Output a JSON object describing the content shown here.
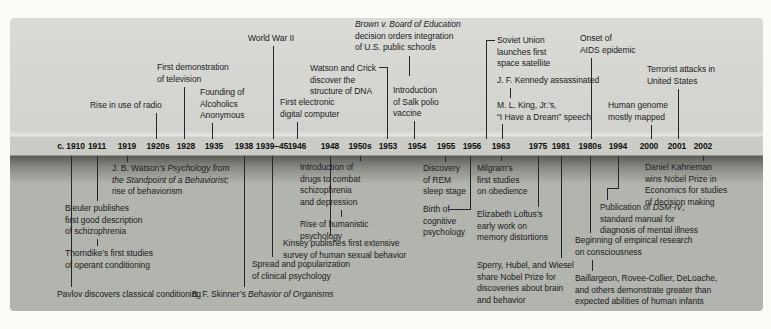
{
  "figure": {
    "type": "timeline",
    "colors": {
      "page_bg": "#fbfbf8",
      "panel_top_bg": "#d5d6d1",
      "year_strip_bg": "#cbccc6",
      "shadow_band_top": "#5c5d59",
      "panel_bottom_bg": "#b2b4ae",
      "line_color": "#26262a",
      "text_color": "#1b1b1b"
    },
    "years": [
      {
        "label": "c. 1910",
        "x": 71
      },
      {
        "label": "1911",
        "x": 97
      },
      {
        "label": "1919",
        "x": 127
      },
      {
        "label": "1920s",
        "x": 158
      },
      {
        "label": "1928",
        "x": 186
      },
      {
        "label": "1935",
        "x": 214
      },
      {
        "label": "1938",
        "x": 244
      },
      {
        "label": "1939–45",
        "x": 272
      },
      {
        "label": "1946",
        "x": 297
      },
      {
        "label": "1948",
        "x": 330
      },
      {
        "label": "1950s",
        "x": 360
      },
      {
        "label": "1953",
        "x": 388
      },
      {
        "label": "1954",
        "x": 417
      },
      {
        "label": "1955",
        "x": 446
      },
      {
        "label": "1956",
        "x": 472
      },
      {
        "label": "1963",
        "x": 501
      },
      {
        "label": "1975",
        "x": 538
      },
      {
        "label": "1981",
        "x": 561
      },
      {
        "label": "1980s",
        "x": 590
      },
      {
        "label": "1994",
        "x": 618
      },
      {
        "label": "2000",
        "x": 649
      },
      {
        "label": "2001",
        "x": 677
      },
      {
        "label": "2002",
        "x": 703
      }
    ],
    "events_above": [
      {
        "id": "radio",
        "year": "1920s",
        "x": 90,
        "y": 100,
        "lines": [
          "Rise in use of radio"
        ],
        "connectors": [
          {
            "type": "v",
            "x": 156,
            "y1": 113,
            "y2": 139
          }
        ]
      },
      {
        "id": "television",
        "year": "1928",
        "x": 157,
        "y": 62,
        "lines": [
          "First demonstration",
          "of television"
        ],
        "connectors": [
          {
            "type": "v",
            "x": 184,
            "y1": 87,
            "y2": 139
          }
        ]
      },
      {
        "id": "alcoholics-anonymous",
        "year": "1935",
        "x": 200,
        "y": 87,
        "lines": [
          "Founding of",
          "Alcoholics",
          "Anonymous"
        ],
        "connectors": [
          {
            "type": "v",
            "x": 212,
            "y1": 123,
            "y2": 139
          }
        ]
      },
      {
        "id": "world-war-2",
        "year": "1939–45",
        "x": 248,
        "y": 33,
        "lines": [
          "World War II"
        ],
        "connectors": [
          {
            "type": "v",
            "x": 273,
            "y1": 46,
            "y2": 139
          }
        ]
      },
      {
        "id": "digital-computer",
        "year": "1946",
        "x": 280,
        "y": 97,
        "lines": [
          "First electronic",
          "digital computer"
        ],
        "connectors": [
          {
            "type": "v",
            "x": 297,
            "y1": 122,
            "y2": 139
          }
        ]
      },
      {
        "id": "watson-crick",
        "year": "1953",
        "x": 310,
        "y": 63,
        "lines": [
          "Watson and Crick",
          "discover the",
          "structure of DNA"
        ],
        "connectors": [
          {
            "type": "h",
            "y": 67,
            "x1": 379,
            "x2": 388
          },
          {
            "type": "v",
            "x": 387,
            "y1": 67,
            "y2": 139
          }
        ]
      },
      {
        "id": "brown-v-board",
        "year": "1954",
        "x": 355,
        "y": 19,
        "lines": [
          "*Brown v. Board of Education*",
          "decision orders integration",
          "of U.S. public schools"
        ],
        "connectors": [
          {
            "type": "v",
            "x": 409,
            "y1": 56,
            "y2": 76
          }
        ]
      },
      {
        "id": "salk-vaccine",
        "year": "1954",
        "x": 393,
        "y": 85,
        "lines": [
          "Introduction",
          "of Salk polio",
          "vaccine"
        ],
        "connectors": [
          {
            "type": "v",
            "x": 414,
            "y1": 121,
            "y2": 139
          }
        ]
      },
      {
        "id": "soviet-satellite",
        "year": "1956",
        "x": 497,
        "y": 35,
        "lines": [
          "Soviet Union",
          "launches first",
          "space satellite"
        ],
        "connectors": [
          {
            "type": "h",
            "y": 40,
            "x1": 486,
            "x2": 495
          },
          {
            "type": "v",
            "x": 486,
            "y1": 40,
            "y2": 139
          }
        ]
      },
      {
        "id": "jfk-assassinated",
        "year": "1963",
        "x": 497,
        "y": 75,
        "lines": [
          "J. F. Kennedy assassinated"
        ],
        "connectors": [
          {
            "type": "v",
            "x": 510,
            "y1": 88,
            "y2": 98
          }
        ]
      },
      {
        "id": "mlk-speech",
        "year": "1963",
        "x": 497,
        "y": 100,
        "lines": [
          "M. L. King, Jr.’s,",
          "“I Have a Dream” speech"
        ],
        "connectors": [
          {
            "type": "v",
            "x": 502,
            "y1": 124,
            "y2": 139
          }
        ]
      },
      {
        "id": "aids-epidemic",
        "year": "1980s",
        "x": 580,
        "y": 33,
        "lines": [
          "Onset of",
          "AIDS epidemic"
        ],
        "connectors": [
          {
            "type": "v",
            "x": 591,
            "y1": 58,
            "y2": 139
          }
        ]
      },
      {
        "id": "human-genome",
        "year": "2000",
        "x": 608,
        "y": 100,
        "lines": [
          "Human genome",
          "mostly mapped"
        ],
        "connectors": [
          {
            "type": "v",
            "x": 651,
            "y1": 125,
            "y2": 139
          }
        ]
      },
      {
        "id": "terrorist-attacks",
        "year": "2001",
        "x": 647,
        "y": 64,
        "lines": [
          "Terrorist attacks in",
          "United States"
        ],
        "connectors": [
          {
            "type": "v",
            "x": 678,
            "y1": 89,
            "y2": 139
          }
        ]
      }
    ],
    "events_below": [
      {
        "id": "pavlov",
        "year": "c. 1910",
        "x": 57,
        "y": 289,
        "lines": [
          "Pavlov discovers classical conditioning"
        ],
        "connectors": [
          {
            "type": "v",
            "x": 71,
            "y1": 156,
            "y2": 287
          }
        ]
      },
      {
        "id": "bleuler",
        "year": "1911",
        "x": 65,
        "y": 203,
        "lines": [
          "Bleuler publishes",
          "first good description",
          "of schizophrenia"
        ],
        "connectors": [
          {
            "type": "v",
            "x": 97,
            "y1": 156,
            "y2": 201
          },
          {
            "type": "v",
            "x": 97,
            "y1": 239,
            "y2": 246
          }
        ]
      },
      {
        "id": "thorndike",
        "year": "1911",
        "x": 65,
        "y": 248,
        "lines": [
          "Thorndike’s first studies",
          "of operant conditioning"
        ],
        "connectors": []
      },
      {
        "id": "jb-watson-behaviorism",
        "year": "1919",
        "x": 112,
        "y": 163,
        "lines": [
          "J. B. Watson’s *Psychology from*",
          "*the Standpoint of a Behaviorist;*",
          "rise of behaviorism"
        ],
        "connectors": [
          {
            "type": "v",
            "x": 127,
            "y1": 156,
            "y2": 162
          }
        ]
      },
      {
        "id": "skinner",
        "year": "1938",
        "x": 192,
        "y": 289,
        "lines": [
          "B. F. Skinner’s *Behavior of Organisms*"
        ],
        "connectors": [
          {
            "type": "v",
            "x": 244,
            "y1": 156,
            "y2": 287
          }
        ]
      },
      {
        "id": "clinical-psychology",
        "year": "1939–45",
        "x": 252,
        "y": 259,
        "lines": [
          "Spread and popularization",
          "of clinical psychology"
        ],
        "connectors": [
          {
            "type": "v",
            "x": 272,
            "y1": 156,
            "y2": 257
          }
        ]
      },
      {
        "id": "kinsey",
        "year": "1948",
        "x": 283,
        "y": 238,
        "lines": [
          "Kinsey publishes first extensive",
          "survey of human sexual behavior"
        ],
        "connectors": [
          {
            "type": "v",
            "x": 330,
            "y1": 156,
            "y2": 236
          }
        ]
      },
      {
        "id": "drugs",
        "year": "1950s",
        "x": 300,
        "y": 162,
        "lines": [
          "Introduction of",
          "drugs to combat",
          "schizophrenia",
          "and depression"
        ],
        "connectors": [
          {
            "type": "v",
            "x": 360,
            "y1": 156,
            "y2": 161
          },
          {
            "type": "v",
            "x": 341,
            "y1": 210,
            "y2": 217
          }
        ]
      },
      {
        "id": "humanistic-psychology",
        "year": "1950s",
        "x": 300,
        "y": 219,
        "lines": [
          "Rise of humanistic",
          "psychology"
        ],
        "connectors": []
      },
      {
        "id": "rem-sleep",
        "year": "1955",
        "x": 423,
        "y": 163,
        "lines": [
          "Discovery",
          "of REM",
          "sleep stage"
        ],
        "connectors": [
          {
            "type": "v",
            "x": 445,
            "y1": 156,
            "y2": 162
          }
        ]
      },
      {
        "id": "cognitive-psychology",
        "year": "1956",
        "x": 423,
        "y": 204,
        "lines": [
          "Birth of",
          "cognitive",
          "psychology"
        ],
        "connectors": [
          {
            "type": "v",
            "x": 470,
            "y1": 156,
            "y2": 210
          },
          {
            "type": "h",
            "y": 209,
            "x1": 449,
            "x2": 470
          }
        ]
      },
      {
        "id": "milgram",
        "year": "1963",
        "x": 477,
        "y": 163,
        "lines": [
          "Milgram’s",
          "first studies",
          "on obedience"
        ],
        "connectors": [
          {
            "type": "v",
            "x": 501,
            "y1": 156,
            "y2": 161
          }
        ]
      },
      {
        "id": "loftus",
        "year": "1975",
        "x": 477,
        "y": 209,
        "lines": [
          "Elizabeth Loftus’s",
          "early work on",
          "memory distortions"
        ],
        "connectors": [
          {
            "type": "v",
            "x": 538,
            "y1": 156,
            "y2": 207
          }
        ]
      },
      {
        "id": "sperry-hubel-wiesel",
        "year": "1981",
        "x": 477,
        "y": 260,
        "lines": [
          "Sperry, Hubel, and Wiesel",
          "share Nobel Prize for",
          "discoveries about brain",
          "and behavior"
        ],
        "connectors": [
          {
            "type": "v",
            "x": 561,
            "y1": 156,
            "y2": 258
          }
        ]
      },
      {
        "id": "consciousness-research",
        "year": "1980s",
        "x": 575,
        "y": 235,
        "lines": [
          "Beginning of empirical research",
          "on consciousness"
        ],
        "connectors": [
          {
            "type": "v",
            "x": 590,
            "y1": 156,
            "y2": 233
          },
          {
            "type": "v",
            "x": 592,
            "y1": 260,
            "y2": 271
          }
        ]
      },
      {
        "id": "baillargeon",
        "year": "1980s",
        "x": 575,
        "y": 273,
        "lines": [
          "Baillargeon, Rovee-Collier, DeLoache,",
          "and others demonstrate greater than",
          "expected abilities of human infants"
        ],
        "connectors": []
      },
      {
        "id": "dsm-iv",
        "year": "1994",
        "x": 600,
        "y": 202,
        "lines": [
          "Publication of *DSM-IV*,",
          "standard manual for",
          "diagnosis of mental illness"
        ],
        "connectors": [
          {
            "type": "v",
            "x": 618,
            "y1": 156,
            "y2": 189
          },
          {
            "type": "h",
            "y": 188,
            "x1": 607,
            "x2": 619
          },
          {
            "type": "v",
            "x": 607,
            "y1": 188,
            "y2": 200
          }
        ]
      },
      {
        "id": "kahneman",
        "year": "2002",
        "x": 645,
        "y": 162,
        "lines": [
          "Daniel Kahneman",
          "wins Nobel Prize in",
          "Economics for studies",
          "of decision making"
        ],
        "connectors": [
          {
            "type": "v",
            "x": 703,
            "y1": 156,
            "y2": 161
          }
        ]
      }
    ]
  }
}
